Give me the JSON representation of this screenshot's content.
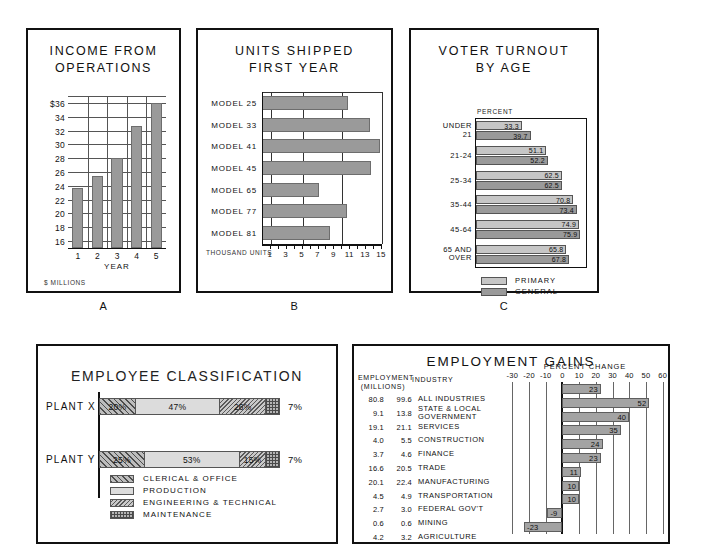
{
  "chart_data": [
    {
      "id": "A",
      "type": "bar",
      "title": "INCOME FROM OPERATIONS",
      "panel_letter": "A",
      "xlabel": "YEAR",
      "ylabel": "",
      "footnote": "$ MILLIONS",
      "categories": [
        "1",
        "2",
        "3",
        "4",
        "5"
      ],
      "values": [
        23.7,
        25.4,
        28.1,
        32.6,
        36.0
      ],
      "ylim": [
        15,
        37
      ],
      "yticks": [
        16,
        18,
        20,
        22,
        24,
        26,
        28,
        30,
        32,
        34,
        36
      ],
      "yticklabels": [
        "16",
        "18",
        "20",
        "22",
        "24",
        "26",
        "28",
        "30",
        "32",
        "34",
        "$36"
      ],
      "grid": true,
      "legend": "none"
    },
    {
      "id": "B",
      "type": "bar",
      "orientation": "horizontal",
      "title": "UNITS SHIPPED FIRST YEAR",
      "title_line1": "UNITS SHIPPED",
      "title_line2": "FIRST YEAR",
      "panel_letter": "B",
      "xlabel": "THOUSAND UNITS",
      "categories": [
        "MODEL 25",
        "MODEL 33",
        "MODEL 41",
        "MODEL 45",
        "MODEL 65",
        "MODEL 77",
        "MODEL 81"
      ],
      "values": [
        10.7,
        13.5,
        14.7,
        13.6,
        7.0,
        10.6,
        8.5
      ],
      "xlim": [
        0,
        15
      ],
      "xticks": [
        1,
        2,
        3,
        4,
        5,
        6,
        7,
        8,
        9,
        10,
        11,
        12,
        13,
        14,
        15
      ],
      "xticklabels": [
        "1",
        "3",
        "5",
        "7",
        "9",
        "11",
        "13",
        "15"
      ],
      "gridlines_at": [
        1,
        5,
        10,
        15
      ],
      "grid": true,
      "legend": "none"
    },
    {
      "id": "C",
      "type": "bar",
      "orientation": "horizontal",
      "title": "VOTER TURNOUT BY AGE",
      "title_line1": "VOTER TURNOUT",
      "title_line2": "BY AGE",
      "panel_letter": "C",
      "axis_note": "PERCENT",
      "categories": [
        "UNDER 21",
        "21-24",
        "25-34",
        "35-44",
        "45-64",
        "65 AND OVER"
      ],
      "category_lines": [
        [
          "UNDER",
          "21"
        ],
        [
          "21-24"
        ],
        [
          "25-34"
        ],
        [
          "35-44"
        ],
        [
          "45-64"
        ],
        [
          "65 AND",
          "OVER"
        ]
      ],
      "series": [
        {
          "name": "PRIMARY",
          "values": [
            33.3,
            51.1,
            62.5,
            70.8,
            74.9,
            65.8
          ],
          "color": "#c6c6c6"
        },
        {
          "name": "GENERAL",
          "values": [
            39.7,
            52.2,
            62.5,
            73.4,
            75.9,
            67.8
          ],
          "color": "#9a9a9a"
        }
      ],
      "value_labels": [
        [
          "33.3",
          "39.7"
        ],
        [
          "51.1",
          "52.2"
        ],
        [
          "62.5",
          "62.5"
        ],
        [
          "70.8",
          "73.4"
        ],
        [
          "74.9",
          "75.9"
        ],
        [
          "65.8",
          "67.8"
        ]
      ],
      "xlim": [
        0,
        80
      ],
      "legend": "bottom-left",
      "grid": false
    },
    {
      "id": "D",
      "type": "bar",
      "orientation": "horizontal-stacked",
      "title": "EMPLOYEE CLASSIFICATION",
      "categories": [
        "PLANT X",
        "PLANT Y"
      ],
      "series": [
        {
          "name": "CLERICAL & OFFICE",
          "values": [
            20,
            25
          ],
          "fill": "f-clerical"
        },
        {
          "name": "PRODUCTION",
          "values": [
            47,
            53
          ],
          "fill": "f-production"
        },
        {
          "name": "ENGINEERING & TECHNICAL",
          "values": [
            26,
            15
          ],
          "fill": "f-engineering"
        },
        {
          "name": "MAINTENANCE",
          "values": [
            7,
            7
          ],
          "fill": "f-maintenance"
        }
      ],
      "segment_labels": [
        [
          "20%",
          "47%",
          "26%",
          "7%"
        ],
        [
          "25%",
          "53%",
          "15%",
          "7%"
        ]
      ],
      "outside_labels": [
        "7%",
        "7%"
      ],
      "legend": "bottom-left",
      "xlim": [
        0,
        100
      ]
    },
    {
      "id": "E",
      "type": "bar",
      "orientation": "horizontal",
      "title": "EMPLOYMENT GAINS",
      "column_headers": {
        "employment": "EMPLOYMENT (MILLIONS)",
        "employment_line1": "EMPLOYMENT",
        "employment_line2": "(MILLIONS)",
        "industry": "INDUSTRY",
        "percent_change": "PERCENT CHANGE"
      },
      "categories": [
        "ALL INDUSTRIES",
        "STATE & LOCAL GOVERNMENT",
        "SERVICES",
        "CONSTRUCTION",
        "FINANCE",
        "TRADE",
        "MANUFACTURING",
        "TRANSPORTATION",
        "FEDERAL GOV'T",
        "MINING",
        "AGRICULTURE"
      ],
      "category_lines": [
        [
          "ALL INDUSTRIES"
        ],
        [
          "STATE & LOCAL",
          "GOVERNMENT"
        ],
        [
          "SERVICES"
        ],
        [
          "CONSTRUCTION"
        ],
        [
          "FINANCE"
        ],
        [
          "TRADE"
        ],
        [
          "MANUFACTURING"
        ],
        [
          "TRANSPORTATION"
        ],
        [
          "FEDERAL GOV'T"
        ],
        [
          "MINING"
        ],
        [
          "AGRICULTURE"
        ]
      ],
      "employment_col1": [
        "80.8",
        "9.1",
        "19.1",
        "4.0",
        "3.7",
        "16.6",
        "20.1",
        "4.5",
        "2.7",
        "0.6",
        "4.2"
      ],
      "employment_col2": [
        "99.6",
        "13.8",
        "21.1",
        "5.5",
        "4.6",
        "20.5",
        "22.4",
        "4.9",
        "3.0",
        "0.6",
        "3.2"
      ],
      "values": [
        23,
        52,
        40,
        35,
        24,
        23,
        11,
        10,
        10,
        -9,
        -23
      ],
      "value_labels": [
        "23",
        "52",
        "40",
        "35",
        "24",
        "23",
        "11",
        "10",
        "10",
        "-9",
        "-23"
      ],
      "xlim": [
        -35,
        62
      ],
      "xticks": [
        -30,
        -20,
        -10,
        0,
        10,
        20,
        30,
        40,
        50,
        60
      ],
      "xticklabels": [
        "-30",
        "-20",
        "-10",
        "0",
        "10",
        "20",
        "30",
        "40",
        "50",
        "60"
      ],
      "grid": true,
      "legend": "none"
    }
  ],
  "panels": {
    "a": {
      "letter": "A",
      "title_line1": "INCOME FROM",
      "title_line2": "OPERATIONS",
      "xaxis_title": "YEAR",
      "footnote": "$ MILLIONS"
    },
    "b": {
      "letter": "B",
      "title_line1": "UNITS SHIPPED",
      "title_line2": "FIRST YEAR",
      "units_label": "THOUSAND UNITS"
    },
    "c": {
      "letter": "C",
      "title_line1": "VOTER TURNOUT",
      "title_line2": "BY AGE",
      "percent_label": "PERCENT",
      "legend": [
        "PRIMARY",
        "GENERAL"
      ]
    },
    "d": {
      "title": "EMPLOYEE CLASSIFICATION",
      "legend": [
        "CLERICAL & OFFICE",
        "PRODUCTION",
        "ENGINEERING & TECHNICAL",
        "MAINTENANCE"
      ]
    },
    "e": {
      "title": "EMPLOYMENT GAINS",
      "head_employment_1": "EMPLOYMENT",
      "head_employment_2": "(MILLIONS)",
      "head_industry": "INDUSTRY",
      "head_percent": "PERCENT CHANGE"
    }
  },
  "colors": {
    "bar_fill": "#9a9a9a",
    "bar_fill_light": "#c6c6c6",
    "bar_stroke": "#6d6d6d",
    "frame": "#111111",
    "grid": "#555555",
    "page_bg": "#ffffff"
  }
}
